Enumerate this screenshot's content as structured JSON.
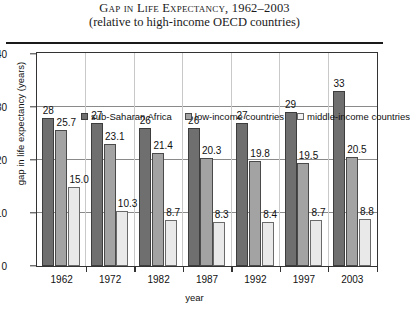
{
  "title": {
    "line1": "Gap in Life Expectancy, 1962–2003",
    "line2": "(relative to high-income OECD countries)"
  },
  "chart_data": {
    "type": "bar",
    "title": "Gap in Life Expectancy, 1962–2003 (relative to high-income OECD countries)",
    "xlabel": "year",
    "ylabel": "gap in life expectancy (years)",
    "ylim": [
      0,
      40
    ],
    "yticks": [
      "0",
      "10",
      "20",
      "30",
      "40"
    ],
    "grid": "horizontal",
    "legend_position": "top-inside",
    "categories": [
      "1962",
      "1972",
      "1982",
      "1987",
      "1992",
      "1997",
      "2003"
    ],
    "series": [
      {
        "name": "sub-Saharan Africa",
        "color": "#6f6f6f",
        "values": [
          28,
          27,
          26,
          26,
          27,
          29,
          33
        ],
        "labels": [
          "28",
          "27",
          "26",
          "26",
          "27",
          "29",
          "33"
        ]
      },
      {
        "name": "low-income countries",
        "color": "#a3a3a3",
        "values": [
          25.7,
          23.1,
          21.4,
          20.3,
          19.8,
          19.5,
          20.5
        ],
        "labels": [
          "25.7",
          "23.1",
          "21.4",
          "20.3",
          "19.8",
          "19.5",
          "20.5"
        ]
      },
      {
        "name": "middle-income countries",
        "color": "#e9e9e9",
        "values": [
          15.0,
          10.3,
          8.7,
          8.3,
          8.4,
          8.7,
          8.8
        ],
        "labels": [
          "15.0",
          "10.3",
          "8.7",
          "8.3",
          "8.4",
          "8.7",
          "8.8"
        ]
      }
    ]
  }
}
